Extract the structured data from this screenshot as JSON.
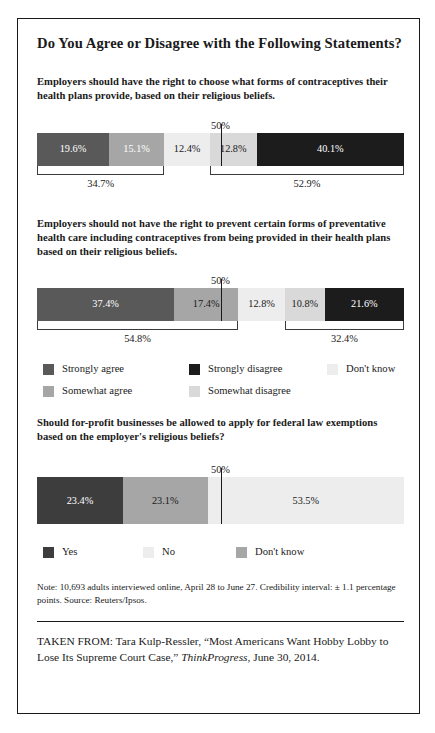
{
  "figure": {
    "title": "Do You Agree or Disagree with the Following Statements?",
    "axis_marker_label": "50%",
    "note": "Note: 10,693 adults interviewed online, April 28 to June 27. Credibility interval: ± 1.1 percentage points. Source: Reuters/Ipsos.",
    "taken_from_prefix": "TAKEN FROM: Tara Kulp-Ressler, “Most Americans Want Hobby Lobby to Lose Its Supreme Court Case,” ",
    "taken_from_italic": "ThinkProgress",
    "taken_from_suffix": ", June 30, 2014."
  },
  "colors": {
    "strongly_agree": "#595959",
    "somewhat_agree": "#a6a6a6",
    "dont_know": "#ededed",
    "somewhat_disagree": "#d9d9d9",
    "strongly_disagree": "#1c1c1c",
    "no": "#ededed",
    "yes": "#3d3d3d",
    "dont_know_3": "#a6a6a6",
    "line": "#1a1a1a",
    "text": "#1a1a1a"
  },
  "legend_main": {
    "items": [
      {
        "label": "Strongly agree",
        "color_key": "strongly_agree",
        "col": 0,
        "row": 0
      },
      {
        "label": "Somewhat agree",
        "color_key": "somewhat_agree",
        "col": 0,
        "row": 1
      },
      {
        "label": "Strongly disagree",
        "color_key": "strongly_disagree",
        "col": 1,
        "row": 0
      },
      {
        "label": "Somewhat disagree",
        "color_key": "somewhat_disagree",
        "col": 1,
        "row": 1
      },
      {
        "label": "Don't know",
        "color_key": "dont_know",
        "col": 2,
        "row": 0
      }
    ]
  },
  "legend_third": {
    "items": [
      {
        "label": "Yes",
        "color_key": "yes"
      },
      {
        "label": "No",
        "color_key": "no"
      },
      {
        "label": "Don't know",
        "color_key": "dont_know_3"
      }
    ]
  },
  "chart_data": [
    {
      "id": "chart-1",
      "type": "bar",
      "orientation": "horizontal-stacked",
      "title": "Employers should have the right to choose what forms of contraceptives their health plans provide, based on their religious beliefs.",
      "xlabel": "",
      "ylabel": "",
      "xlim": [
        0,
        100
      ],
      "grid": false,
      "marker": {
        "value": 50,
        "label": "50%"
      },
      "categories": [
        "Strongly agree",
        "Somewhat agree",
        "Don't know",
        "Somewhat disagree",
        "Strongly disagree"
      ],
      "values": [
        19.6,
        15.1,
        12.4,
        12.8,
        40.1
      ],
      "data_labels": [
        "19.6%",
        "15.1%",
        "12.4%",
        "12.8%",
        "40.1%"
      ],
      "label_text_light": [
        true,
        true,
        false,
        false,
        true
      ],
      "segment_colors": [
        "strongly_agree",
        "somewhat_agree",
        "dont_know",
        "somewhat_disagree",
        "strongly_disagree"
      ],
      "brackets": [
        {
          "label": "34.7%",
          "start": 0,
          "end": 34.7
        },
        {
          "label": "52.9%",
          "start": 47.1,
          "end": 100
        }
      ]
    },
    {
      "id": "chart-2",
      "type": "bar",
      "orientation": "horizontal-stacked",
      "title": "Employers should not have the right to prevent certain forms of preventative health care including contraceptives from being provided in their health plans based on their religious beliefs.",
      "xlabel": "",
      "ylabel": "",
      "xlim": [
        0,
        100
      ],
      "grid": false,
      "marker": {
        "value": 50,
        "label": "50%"
      },
      "categories": [
        "Strongly agree",
        "Somewhat agree",
        "Don't know",
        "Somewhat disagree",
        "Strongly disagree"
      ],
      "values": [
        37.4,
        17.4,
        12.8,
        10.8,
        21.6
      ],
      "data_labels": [
        "37.4%",
        "17.4%",
        "12.8%",
        "10.8%",
        "21.6%"
      ],
      "label_text_light": [
        true,
        false,
        false,
        false,
        true
      ],
      "segment_colors": [
        "strongly_agree",
        "somewhat_agree",
        "dont_know",
        "somewhat_disagree",
        "strongly_disagree"
      ],
      "brackets": [
        {
          "label": "54.8%",
          "start": 0,
          "end": 54.8
        },
        {
          "label": "32.4%",
          "start": 67.6,
          "end": 100
        }
      ]
    },
    {
      "id": "chart-3",
      "type": "bar",
      "orientation": "horizontal-stacked",
      "title": "Should for-profit businesses be allowed to apply for federal law exemptions based on the employer's religious beliefs?",
      "xlabel": "",
      "ylabel": "",
      "xlim": [
        0,
        100
      ],
      "grid": false,
      "marker": {
        "value": 50,
        "label": "50%"
      },
      "categories": [
        "Yes",
        "Don't know",
        "No"
      ],
      "values": [
        23.4,
        23.1,
        53.5
      ],
      "data_labels": [
        "23.4%",
        "23.1%",
        "53.5%"
      ],
      "label_text_light": [
        true,
        false,
        false
      ],
      "segment_colors": [
        "yes",
        "dont_know_3",
        "no"
      ],
      "brackets": []
    }
  ]
}
